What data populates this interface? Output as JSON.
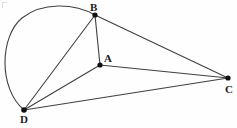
{
  "figure": {
    "background_color": "#fefefe",
    "stroke_color": "#404040",
    "vertex_fill_color": "#101010",
    "label_color": "#1c1c1c",
    "canvas": {
      "width": 237,
      "height": 128
    }
  },
  "points": [
    {
      "id": "B",
      "label": "B",
      "x": 95,
      "y": 15,
      "label_x": 90,
      "label_y": 2,
      "dot_radius": 2.6
    },
    {
      "id": "A",
      "label": "A",
      "x": 100,
      "y": 65,
      "label_x": 104,
      "label_y": 53,
      "dot_radius": 2.6
    },
    {
      "id": "C",
      "label": "C",
      "x": 228,
      "y": 78,
      "label_x": 225,
      "label_y": 84,
      "dot_radius": 2.6
    },
    {
      "id": "D",
      "label": "D",
      "x": 24,
      "y": 110,
      "label_x": 20,
      "label_y": 114,
      "dot_radius": 2.8
    }
  ],
  "segments": [
    {
      "id": "BA",
      "from": "B",
      "to": "A",
      "x1": 95,
      "y1": 15,
      "x2": 100,
      "y2": 65
    },
    {
      "id": "BC",
      "from": "B",
      "to": "C",
      "x1": 95,
      "y1": 15,
      "x2": 228,
      "y2": 78
    },
    {
      "id": "BD",
      "from": "B",
      "to": "D",
      "x1": 95,
      "y1": 15,
      "x2": 24,
      "y2": 110
    },
    {
      "id": "AC",
      "from": "A",
      "to": "C",
      "x1": 100,
      "y1": 65,
      "x2": 228,
      "y2": 78
    },
    {
      "id": "AD",
      "from": "A",
      "to": "D",
      "x1": 100,
      "y1": 65,
      "x2": 24,
      "y2": 110
    },
    {
      "id": "DC",
      "from": "D",
      "to": "C",
      "x1": 24,
      "y1": 110,
      "x2": 228,
      "y2": 78
    }
  ],
  "arc": {
    "id": "arc-DB",
    "from": "D",
    "to": "B",
    "description": "circular arc bulging left and up from D to B",
    "path": "M 24 110 C -2 88 0 36 22 18 C 42 2 74 3 95 15"
  },
  "artifact": {
    "id": "corner-mark",
    "description": "faint scan artifact at top-left corner"
  }
}
